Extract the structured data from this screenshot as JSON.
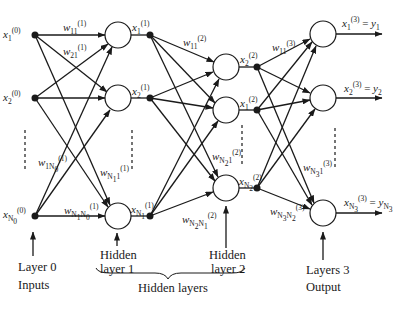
{
  "diagram": {
    "layers": [
      {
        "name": "Layer 0",
        "role": "Inputs",
        "nodes": [
          "x1(0)",
          "x2(0)",
          "xN0(0)"
        ]
      },
      {
        "name": "Hidden layer 1",
        "nodes": [
          "x1(1)",
          "x2(1)",
          "xN1(1)"
        ]
      },
      {
        "name": "Hidden layer 2",
        "nodes": [
          "x2(2)",
          "x1(2)",
          "xN2(2)"
        ]
      },
      {
        "name": "Layers 3",
        "role": "Output",
        "nodes": [
          "x1(3) = y1",
          "x2(3) = y2",
          "xN3(3) = yN3"
        ]
      }
    ],
    "weights_shown": [
      "w11(1)",
      "w21(1)",
      "w1N0(1)",
      "wN11(1)",
      "wN1N0(1)",
      "w11(2)",
      "wN21(2)",
      "wN2N1(2)",
      "w11(3)",
      "wN31(3)",
      "wN3N2(3)"
    ]
  },
  "captions": {
    "layer0": "Layer 0",
    "inputs": "Inputs",
    "hidden1_a": "Hidden",
    "hidden1_b": "layer 1",
    "hidden2_a": "Hidden",
    "hidden2_b": "layer 2",
    "hidden_layers": "Hidden layers",
    "layer3": "Layers 3",
    "output": "Output"
  },
  "colors": {
    "stroke": "#1a1a1a",
    "background": "#ffffff"
  }
}
